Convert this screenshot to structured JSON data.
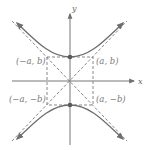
{
  "diagram": {
    "type": "hyperbola-vertical-transverse-axis",
    "axes": {
      "x_label": "x",
      "y_label": "y"
    },
    "points": [
      {
        "id": "top-left",
        "label": "(−a, b)"
      },
      {
        "id": "top-right",
        "label": "(a, b)"
      },
      {
        "id": "bottom-left",
        "label": "(−a, −b)"
      },
      {
        "id": "bottom-right",
        "label": "(a, −b)"
      }
    ],
    "colors": {
      "curve": "#6e6e6e",
      "dashed": "#7a7a7a",
      "axis": "#777777",
      "vertex": "#5a5a5a",
      "label": "#7a7a7a"
    }
  }
}
